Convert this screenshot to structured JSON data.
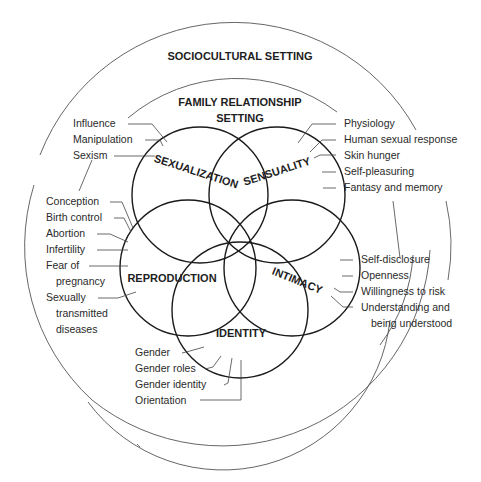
{
  "settings": {
    "outer_label": "SOCIOCULTURAL SETTING",
    "inner_label_line1": "FAMILY RELATIONSHIP",
    "inner_label_line2": "SETTING"
  },
  "circles": {
    "sexualization": "SEXUALIZATION",
    "sensuality": "SENSUALITY",
    "reproduction": "REPRODUCTION",
    "intimacy": "INTIMACY",
    "identity": "IDENTITY"
  },
  "sexualization_items": [
    "Influence",
    "Manipulation",
    "Sexism"
  ],
  "sensuality_items": [
    "Physiology",
    "Human sexual response",
    "Skin hunger",
    "Self-pleasuring",
    "Fantasy and memory"
  ],
  "reproduction_items": [
    "Conception",
    "Birth control",
    "Abortion",
    "Infertility",
    "Fear of",
    "pregnancy",
    "Sexually",
    "transmitted",
    "diseases"
  ],
  "intimacy_items": [
    "Self-disclosure",
    "Openness",
    "Willingness to risk",
    "Understanding and",
    "being understood"
  ],
  "identity_items": [
    "Gender",
    "Gender roles",
    "Gender identity",
    "Orientation"
  ]
}
